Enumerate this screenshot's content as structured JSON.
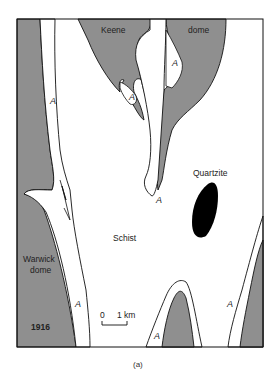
{
  "figure": {
    "caption": "(a)",
    "year": "1916",
    "colors": {
      "dome": "#8f8f8f",
      "quartzite": "#000000",
      "schist": "#ffffff",
      "outline": "#111111"
    },
    "labels": {
      "keene": "Keene",
      "dome": "dome",
      "quartzite": "Quartzite",
      "schist": "Schist",
      "warwick": "Warwick",
      "warwick_dome": "dome",
      "amphibolite": "A"
    },
    "scale_bar": {
      "start": "0",
      "end": "1 km"
    }
  }
}
